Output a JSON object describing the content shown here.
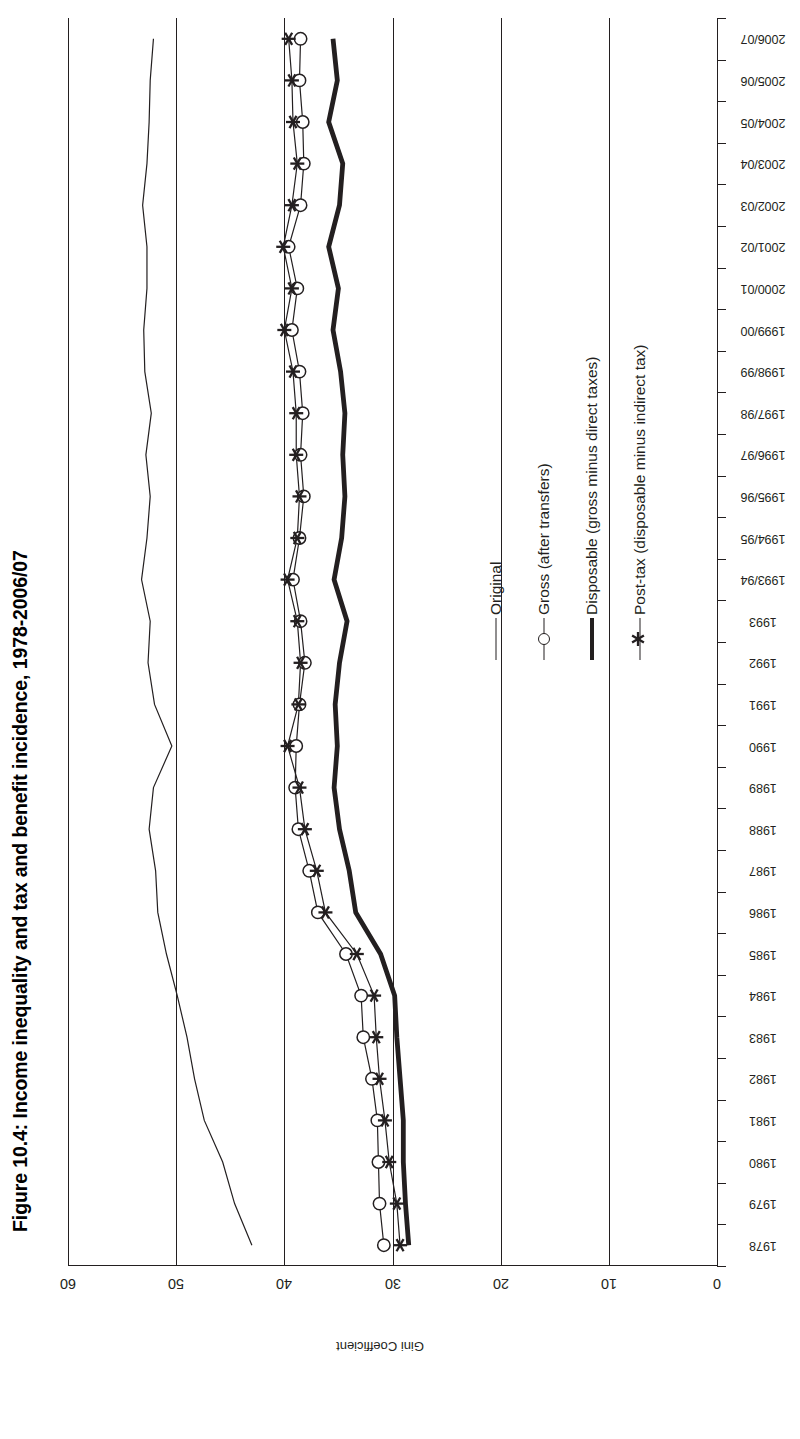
{
  "figure": {
    "title": "Figure 10.4: Income inequality and tax and benefit incidence, 1978-2006/07"
  },
  "value_axis": {
    "title": "Gini Coefficient",
    "ticks": [
      "60",
      "50",
      "40",
      "30",
      "20",
      "10",
      "0"
    ]
  },
  "legend": {
    "items": [
      {
        "label": "Original",
        "marker": "line-thin",
        "icon": "line-icon"
      },
      {
        "label": "Gross (after transfers)",
        "marker": "line-circle",
        "icon": "circle-marker-icon"
      },
      {
        "label": "Disposable (gross minus direct taxes)",
        "marker": "line-thick",
        "icon": "thick-line-icon"
      },
      {
        "label": "Post-tax (disposable minus indirect tax)",
        "marker": "line-star",
        "icon": "star-marker-icon"
      }
    ]
  },
  "chart_data": {
    "type": "line",
    "title": "Figure 10.4: Income inequality and tax and benefit incidence, 1978-2006/07",
    "xlabel": "",
    "ylabel": "Gini Coefficient",
    "ylim": [
      0,
      60
    ],
    "grid": true,
    "orientation": "rotated-90",
    "legend_position": "inside-right",
    "categories": [
      "1978",
      "1979",
      "1980",
      "1981",
      "1982",
      "1983",
      "1984",
      "1985",
      "1986",
      "1987",
      "1988",
      "1989",
      "1990",
      "1991",
      "1992",
      "1993",
      "1993/94",
      "1994/95",
      "1995/96",
      "1996/97",
      "1997/98",
      "1998/99",
      "1999/00",
      "2000/01",
      "2001/02",
      "2002/03",
      "2003/04",
      "2004/05",
      "2005/06",
      "2006/07"
    ],
    "series": [
      {
        "name": "Original",
        "values": [
          43.0,
          44.6,
          45.7,
          47.4,
          48.3,
          49.0,
          49.9,
          50.9,
          51.7,
          51.9,
          52.5,
          52.1,
          50.4,
          52.0,
          52.6,
          52.4,
          53.2,
          52.7,
          52.4,
          52.8,
          52.3,
          52.9,
          53.0,
          52.7,
          52.7,
          53.1,
          52.7,
          52.5,
          52.4,
          52.1
        ]
      },
      {
        "name": "Gross (after transfers)",
        "values": [
          30.8,
          31.2,
          31.3,
          31.4,
          31.9,
          32.7,
          32.9,
          34.3,
          36.9,
          37.7,
          38.7,
          39.0,
          38.9,
          38.6,
          38.1,
          38.5,
          39.2,
          38.6,
          38.2,
          38.5,
          38.3,
          38.6,
          39.3,
          38.8,
          39.6,
          38.5,
          38.2,
          38.3,
          38.6,
          38.5
        ]
      },
      {
        "name": "Disposable (gross minus direct taxes)",
        "values": [
          28.5,
          28.8,
          29.0,
          29.0,
          29.3,
          29.6,
          29.8,
          31.1,
          33.4,
          34.0,
          34.9,
          35.4,
          35.1,
          35.3,
          34.9,
          34.2,
          35.4,
          34.7,
          34.4,
          34.6,
          34.4,
          34.8,
          35.5,
          35.0,
          35.9,
          34.9,
          34.6,
          35.9,
          35.1,
          35.5
        ]
      },
      {
        "name": "Post-tax (disposable minus indirect tax)",
        "values": [
          29.3,
          29.6,
          30.3,
          30.7,
          31.2,
          31.5,
          31.7,
          33.3,
          36.2,
          37.0,
          38.1,
          38.6,
          39.7,
          38.7,
          38.5,
          38.8,
          39.7,
          38.8,
          38.6,
          38.9,
          38.9,
          39.2,
          40.0,
          39.3,
          40.1,
          39.3,
          38.8,
          39.2,
          39.3,
          39.6
        ]
      }
    ]
  }
}
